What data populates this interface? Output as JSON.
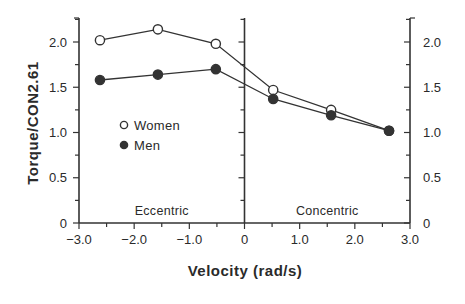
{
  "chart_data": {
    "type": "line",
    "title": "",
    "xlabel": "Velocity (rad/s)",
    "ylabel": "Torque/CON2.61",
    "xlim": [
      -3.0,
      3.0
    ],
    "ylim": [
      0,
      2.25
    ],
    "x_ticks": [
      -3.0,
      -2.0,
      -1.0,
      0,
      1.0,
      2.0,
      3.0
    ],
    "x_tick_labels": [
      "−3.0",
      "−2.0",
      "−1.0",
      "0",
      "1.0",
      "2.0",
      "3.0"
    ],
    "y_ticks": [
      0,
      0.5,
      1.0,
      1.5,
      2.0
    ],
    "y_tick_labels": [
      "0",
      "0.5",
      "1.0",
      "1.5",
      "2.0"
    ],
    "y_minor_step": 0.25,
    "x_minor_step": 0.5,
    "grid": false,
    "dual_y_axis": true,
    "center_divider_x": 0,
    "region_labels": [
      {
        "text": "Eccentric",
        "x": -1.5
      },
      {
        "text": "Concentric",
        "x": 1.5
      }
    ],
    "legend": {
      "position": "inside-left",
      "entries": [
        {
          "name": "Women",
          "marker": "open-circle"
        },
        {
          "name": "Men",
          "marker": "filled-circle"
        }
      ]
    },
    "x": [
      -2.62,
      -1.57,
      -0.52,
      0.52,
      1.57,
      2.62
    ],
    "series": [
      {
        "name": "Women",
        "marker": "open-circle",
        "values": [
          2.02,
          2.14,
          1.98,
          1.47,
          1.25,
          1.02
        ]
      },
      {
        "name": "Men",
        "marker": "filled-circle",
        "values": [
          1.58,
          1.64,
          1.7,
          1.37,
          1.19,
          1.02
        ]
      }
    ]
  },
  "colors": {
    "ink": "#333333",
    "text": "#2a2a2a",
    "background": "#ffffff"
  }
}
